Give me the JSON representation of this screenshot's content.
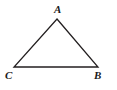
{
  "figure": {
    "kind": "geometry-diagram",
    "shape": "triangle",
    "background_color": "#ffffff",
    "stroke_color": "#231f20",
    "stroke_width": 1.3,
    "label_color": "#1a1a1a",
    "vertices": [
      {
        "id": "A",
        "label": "A",
        "x": 57,
        "y": 19,
        "label_x": 54,
        "label_y": 4
      },
      {
        "id": "C",
        "label": "C",
        "x": 14,
        "y": 67,
        "label_x": 5,
        "label_y": 70
      },
      {
        "id": "B",
        "label": "B",
        "x": 98,
        "y": 67,
        "label_x": 94,
        "label_y": 70
      }
    ],
    "edges": [
      {
        "id": "CA",
        "from": "C",
        "to": "A"
      },
      {
        "id": "AB",
        "from": "A",
        "to": "B"
      },
      {
        "id": "BC",
        "from": "B",
        "to": "C"
      }
    ],
    "polygon_points": "57,19 98,67 14,67"
  }
}
